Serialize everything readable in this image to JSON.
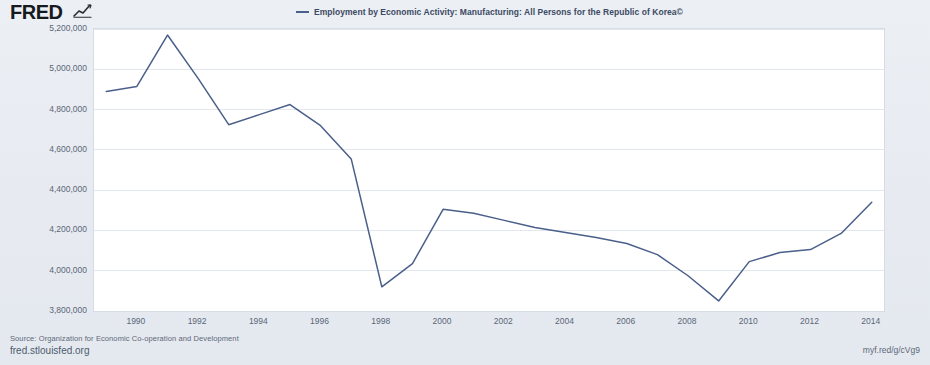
{
  "brand": {
    "logo_text": "FRED",
    "logo_glyph": "chart-line-icon"
  },
  "legend": {
    "series_label": "Employment by Economic Activity: Manufacturing: All Persons for the Republic of Korea©",
    "series_color": "#4a5f8a"
  },
  "footer": {
    "source": "Source: Organization for Economic Co-operation and Development",
    "site_url": "fred.stlouisfed.org",
    "short_url": "myf.red/g/cVg9"
  },
  "chart_data": {
    "type": "line",
    "title": "",
    "xlabel": "",
    "ylabel": "Persons",
    "xlim": [
      1988.6,
      2014.4
    ],
    "ylim": [
      3800000,
      5200000
    ],
    "grid": true,
    "legend_position": "top-center",
    "ytick_labels": [
      "5,200,000",
      "5,000,000",
      "4,800,000",
      "4,600,000",
      "4,400,000",
      "4,200,000",
      "4,000,000",
      "3,800,000"
    ],
    "ytick_values": [
      5200000,
      5000000,
      4800000,
      4600000,
      4400000,
      4200000,
      4000000,
      3800000
    ],
    "xtick_labels": [
      "1990",
      "1992",
      "1994",
      "1996",
      "1998",
      "2000",
      "2002",
      "2004",
      "2006",
      "2008",
      "2010",
      "2012",
      "2014"
    ],
    "xtick_values": [
      1990,
      1992,
      1994,
      1996,
      1998,
      2000,
      2002,
      2004,
      2006,
      2008,
      2010,
      2012,
      2014
    ],
    "series": [
      {
        "name": "Employment by Economic Activity: Manufacturing: All Persons for the Republic of Korea",
        "color": "#4a5f8a",
        "x": [
          1989,
          1990,
          1991,
          1992,
          1993,
          1994,
          1995,
          1996,
          1997,
          1998,
          1999,
          2000,
          2001,
          2002,
          2003,
          2004,
          2005,
          2006,
          2007,
          2008,
          2009,
          2010,
          2011,
          2012,
          2013,
          2014
        ],
        "values": [
          4890000,
          4915000,
          5170000,
          4955000,
          4725000,
          4775000,
          4825000,
          4720000,
          4555000,
          3920000,
          4035000,
          4305000,
          4285000,
          4250000,
          4215000,
          4190000,
          4165000,
          4135000,
          4080000,
          3975000,
          3850000,
          4045000,
          4090000,
          4105000,
          4185000,
          4340000
        ]
      }
    ]
  }
}
